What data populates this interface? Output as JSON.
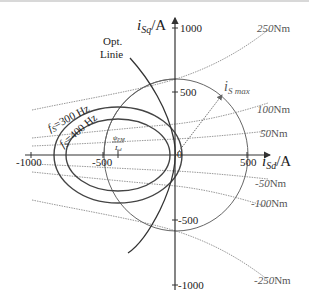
{
  "diagram": {
    "axes": {
      "x_label_main": "i",
      "x_label_sub": "Sd",
      "x_label_unit": "/A",
      "y_label_main": "i",
      "y_label_sub": "Sq",
      "y_label_unit": "/A",
      "x_ticks": [
        "-1000",
        "-500",
        "0",
        "500"
      ],
      "y_ticks": [
        "1000",
        "500",
        "-500",
        "-1000"
      ]
    },
    "labels": {
      "opt_line_1": "Opt.",
      "opt_line_2": "Linie",
      "fs300": "f",
      "fs300_sub": "S",
      "fs300_val": "=300 Hz",
      "fs400": "f",
      "fs400_sub": "S",
      "fs400_val": "=400 Hz",
      "center_num": "ψ",
      "center_num_sub": "PM",
      "center_den": "L",
      "center_den_sub": "d",
      "ismax_main": "i",
      "ismax_sub": "S max"
    },
    "torque_curves": [
      {
        "value": "250",
        "unit": "Nm"
      },
      {
        "value": "100",
        "unit": "Nm"
      },
      {
        "value": "50",
        "unit": "Nm"
      },
      {
        "value": "-50",
        "unit": "Nm"
      },
      {
        "value": "-100",
        "unit": "Nm"
      },
      {
        "value": "-250",
        "unit": "Nm"
      }
    ],
    "colors": {
      "axis": "#333333",
      "ellipse": "#444444",
      "circle": "#666666",
      "torque": "#999999",
      "text": "#222222"
    }
  }
}
